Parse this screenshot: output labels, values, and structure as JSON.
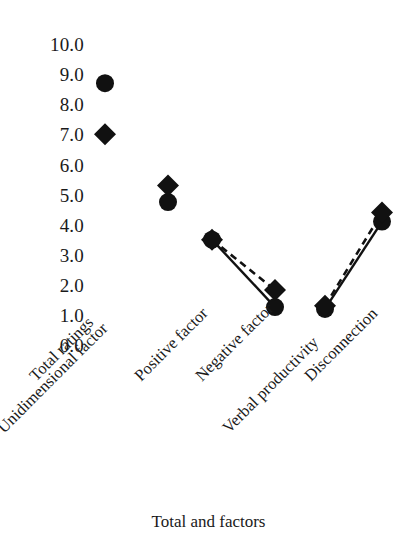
{
  "chart_data": {
    "type": "scatter",
    "title": "",
    "xlabel": "Total and factors",
    "ylabel": "",
    "ylim": [
      0,
      10
    ],
    "ytick_step": 1,
    "grid": false,
    "legend": "none",
    "categories": [
      "Total ratings",
      "Unidimensional factor",
      "Positive factor",
      "Negative factor",
      "Verbal productivity",
      "Disconnection"
    ],
    "ytick_labels": [
      "10.0",
      "9.0",
      "8.0",
      "7.0",
      "6.0",
      "5.0",
      "4.0",
      "3.0",
      "2.0",
      "1.0",
      "0.0"
    ],
    "ytick_values": [
      10,
      9,
      8,
      7,
      6,
      5,
      4,
      3,
      2,
      1,
      0
    ],
    "series": [
      {
        "name": "circle-series",
        "marker": "circle",
        "line": "solid",
        "values": [
          8.7,
          4.75,
          3.5,
          1.26,
          1.2,
          4.1
        ]
      },
      {
        "name": "diamond-series",
        "marker": "diamond",
        "line": "dashed",
        "values": [
          7.0,
          5.3,
          3.5,
          1.83,
          1.3,
          4.4
        ]
      }
    ],
    "connections": [
      {
        "series": "circle-series",
        "style": "solid",
        "from_index": 2,
        "to_index": 3
      },
      {
        "series": "diamond-series",
        "style": "dashed",
        "from_index": 2,
        "to_index": 3
      },
      {
        "series": "circle-series",
        "style": "solid",
        "from_index": 4,
        "to_index": 5
      },
      {
        "series": "diamond-series",
        "style": "dashed",
        "from_index": 4,
        "to_index": 5
      }
    ],
    "marker_color": "#111111",
    "line_color": "#111111"
  },
  "axis": {
    "x_title": "Total and factors"
  }
}
